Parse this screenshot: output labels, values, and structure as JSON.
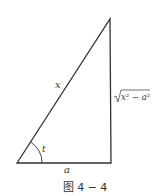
{
  "figure": {
    "caption": "图 4 − 4",
    "labels": {
      "hypotenuse": "x",
      "angle": "t",
      "base": "a",
      "side_radicand": "x² − a²",
      "side_radical": "√"
    },
    "colors": {
      "stroke": "#333333",
      "background": "#ffffff"
    }
  }
}
